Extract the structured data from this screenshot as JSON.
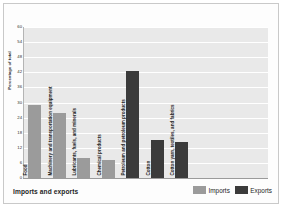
{
  "chart_data": {
    "type": "bar",
    "title": "Imports and exports",
    "xlabel": "",
    "ylabel": "Percentage of total",
    "ylim": [
      0,
      60
    ],
    "yticks": [
      0,
      6,
      12,
      18,
      24,
      30,
      36,
      42,
      48,
      54,
      60
    ],
    "grid": true,
    "legend_position": "bottom-right",
    "categories": [
      "Food",
      "Machinery and transportation equipment",
      "Lubricants, fuels, and minerals",
      "Chemical products",
      "Petroleum and petroleum products",
      "Cotton",
      "Cotton yarn, textiles, and fabrics"
    ],
    "series": [
      {
        "name": "Imports",
        "color": "#9b9b9b",
        "values": [
          29,
          26,
          8,
          7,
          null,
          null,
          null
        ]
      },
      {
        "name": "Exports",
        "color": "#3b3b3b",
        "values": [
          null,
          null,
          null,
          null,
          42.5,
          15,
          14.5
        ]
      }
    ],
    "bars": [
      {
        "label": "Food",
        "value": 29,
        "series": "Imports"
      },
      {
        "label": "Machinery and transportation equipment",
        "value": 26,
        "series": "Imports"
      },
      {
        "label": "Lubricants, fuels, and minerals",
        "value": 8,
        "series": "Imports"
      },
      {
        "label": "Chemical products",
        "value": 7,
        "series": "Imports"
      },
      {
        "label": "Petroleum and petroleum products",
        "value": 42.5,
        "series": "Exports"
      },
      {
        "label": "Cotton",
        "value": 15,
        "series": "Exports"
      },
      {
        "label": "Cotton yarn, textiles, and fabrics",
        "value": 14.5,
        "series": "Exports"
      }
    ]
  },
  "legend": {
    "items": [
      {
        "label": "Imports",
        "color": "#9b9b9b"
      },
      {
        "label": "Exports",
        "color": "#3b3b3b"
      }
    ]
  },
  "footer": {
    "title": "Imports and exports"
  },
  "axis": {
    "y_label": "Percentage of total",
    "tick_0": "0",
    "tick_1": "6",
    "tick_2": "12",
    "tick_3": "18",
    "tick_4": "24",
    "tick_5": "30",
    "tick_6": "36",
    "tick_7": "42",
    "tick_8": "48",
    "tick_9": "54",
    "tick_10": "60"
  },
  "colors": {
    "imports": "#9b9b9b",
    "exports": "#3b3b3b",
    "plot_background": "#e9e9e9",
    "gridline": "#ffffff"
  }
}
